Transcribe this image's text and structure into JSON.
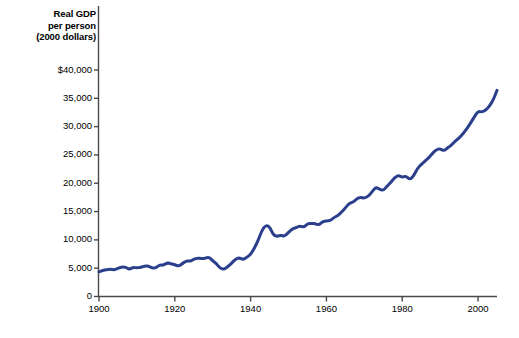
{
  "chart_data": {
    "type": "line",
    "title": "Real GDP per person (2000 dollars)",
    "title_lines": [
      "Real GDP",
      "per person",
      "(2000 dollars)"
    ],
    "xlabel": "",
    "ylabel": "Real GDP per person (2000 dollars)",
    "xlim": [
      1900,
      2005
    ],
    "ylim": [
      0,
      40000
    ],
    "grid": false,
    "legend": null,
    "line_color": "#2B3F8C",
    "line_width_px": 3,
    "xticks": [
      1900,
      1920,
      1940,
      1960,
      1980,
      2000
    ],
    "xtick_labels": [
      "1900",
      "1920",
      "1940",
      "1960",
      "1980",
      "2000"
    ],
    "yticks": [
      0,
      5000,
      10000,
      15000,
      20000,
      25000,
      30000,
      35000,
      40000
    ],
    "ytick_labels": [
      "0",
      "5,000",
      "10,000",
      "15,000",
      "20,000",
      "25,000",
      "30,000",
      "35,000",
      "$40,000"
    ],
    "series": [
      {
        "name": "Real GDP per person",
        "x": [
          1900,
          1901,
          1902,
          1903,
          1904,
          1905,
          1906,
          1907,
          1908,
          1909,
          1910,
          1911,
          1912,
          1913,
          1914,
          1915,
          1916,
          1917,
          1918,
          1919,
          1920,
          1921,
          1922,
          1923,
          1924,
          1925,
          1926,
          1927,
          1928,
          1929,
          1930,
          1931,
          1932,
          1933,
          1934,
          1935,
          1936,
          1937,
          1938,
          1939,
          1940,
          1941,
          1942,
          1943,
          1944,
          1945,
          1946,
          1947,
          1948,
          1949,
          1950,
          1951,
          1952,
          1953,
          1954,
          1955,
          1956,
          1957,
          1958,
          1959,
          1960,
          1961,
          1962,
          1963,
          1964,
          1965,
          1966,
          1967,
          1968,
          1969,
          1970,
          1971,
          1972,
          1973,
          1974,
          1975,
          1976,
          1977,
          1978,
          1979,
          1980,
          1981,
          1982,
          1983,
          1984,
          1985,
          1986,
          1987,
          1988,
          1989,
          1990,
          1991,
          1992,
          1993,
          1994,
          1995,
          1996,
          1997,
          1998,
          1999,
          2000,
          2001,
          2002,
          2003,
          2004,
          2005
        ],
        "values": [
          4350,
          4600,
          4750,
          4820,
          4700,
          4950,
          5250,
          5200,
          4780,
          5150,
          5050,
          5150,
          5350,
          5400,
          5000,
          5050,
          5600,
          5500,
          5950,
          5800,
          5600,
          5350,
          5800,
          6300,
          6250,
          6550,
          6800,
          6700,
          6700,
          7000,
          6300,
          5800,
          4950,
          4800,
          5250,
          5900,
          6600,
          6850,
          6500,
          6950,
          7400,
          8550,
          9900,
          11700,
          12600,
          12350,
          10850,
          10600,
          10850,
          10600,
          11350,
          11950,
          12150,
          12500,
          12200,
          12850,
          12900,
          12900,
          12600,
          13200,
          13350,
          13400,
          13950,
          14300,
          14900,
          15650,
          16450,
          16650,
          17250,
          17550,
          17350,
          17700,
          18450,
          19300,
          18950,
          18700,
          19500,
          20150,
          21000,
          21400,
          21050,
          21300,
          20600,
          21300,
          22600,
          23300,
          23900,
          24500,
          25300,
          25950,
          26100,
          25700,
          26300,
          26700,
          27500,
          27950,
          28700,
          29600,
          30600,
          31700,
          32700,
          32600,
          32900,
          33600,
          34700,
          36400
        ]
      }
    ]
  },
  "axes": {
    "y_axis_name": "y-axis",
    "x_axis_name": "x-axis"
  }
}
